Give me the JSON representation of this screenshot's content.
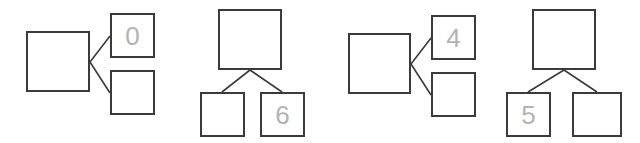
{
  "canvas": {
    "width": 640,
    "height": 143,
    "background": "#ffffff"
  },
  "style": {
    "node_border_color": "#3b3b3b",
    "node_border_width": 2,
    "node_fill": "#ffffff",
    "edge_color": "#3b3b3b",
    "edge_width": 1.6,
    "label_color": "#b3b3b3",
    "label_font_size": 26
  },
  "diagrams": [
    {
      "id": "diagram-1",
      "orientation": "horizontal",
      "offset_x": 0,
      "parent": {
        "name": "parent",
        "label": "",
        "x": 26,
        "y": 31,
        "w": 64,
        "h": 61
      },
      "children": [
        {
          "name": "child-top",
          "label": "0",
          "x": 110,
          "y": 13,
          "w": 45,
          "h": 45
        },
        {
          "name": "child-bottom",
          "label": "",
          "x": 110,
          "y": 70,
          "w": 45,
          "h": 45
        }
      ],
      "edges": [
        {
          "from": "parent",
          "to": "child-top",
          "x1": 90,
          "y1": 62,
          "x2": 110,
          "y2": 36
        },
        {
          "from": "parent",
          "to": "child-bottom",
          "x1": 90,
          "y1": 62,
          "x2": 110,
          "y2": 93
        }
      ]
    },
    {
      "id": "diagram-2",
      "orientation": "vertical",
      "offset_x": 160,
      "parent": {
        "name": "parent",
        "label": "",
        "x": 58,
        "y": 9,
        "w": 64,
        "h": 61
      },
      "children": [
        {
          "name": "child-left",
          "label": "",
          "x": 40,
          "y": 92,
          "w": 45,
          "h": 45
        },
        {
          "name": "child-right",
          "label": "6",
          "x": 100,
          "y": 92,
          "w": 45,
          "h": 45
        }
      ],
      "edges": [
        {
          "from": "parent",
          "to": "child-left",
          "x1": 90,
          "y1": 70,
          "x2": 62,
          "y2": 92
        },
        {
          "from": "parent",
          "to": "child-right",
          "x1": 90,
          "y1": 70,
          "x2": 122,
          "y2": 92
        }
      ]
    },
    {
      "id": "diagram-3",
      "orientation": "horizontal",
      "offset_x": 320,
      "parent": {
        "name": "parent",
        "label": "",
        "x": 28,
        "y": 33,
        "w": 63,
        "h": 61
      },
      "children": [
        {
          "name": "child-top",
          "label": "4",
          "x": 111,
          "y": 15,
          "w": 45,
          "h": 45
        },
        {
          "name": "child-bottom",
          "label": "",
          "x": 111,
          "y": 72,
          "w": 45,
          "h": 45
        }
      ],
      "edges": [
        {
          "from": "parent",
          "to": "child-top",
          "x1": 91,
          "y1": 64,
          "x2": 111,
          "y2": 38
        },
        {
          "from": "parent",
          "to": "child-bottom",
          "x1": 91,
          "y1": 64,
          "x2": 111,
          "y2": 95
        }
      ]
    },
    {
      "id": "diagram-4",
      "orientation": "vertical",
      "offset_x": 480,
      "parent": {
        "name": "parent",
        "label": "",
        "x": 52,
        "y": 9,
        "w": 64,
        "h": 61
      },
      "children": [
        {
          "name": "child-left",
          "label": "5",
          "x": 26,
          "y": 92,
          "w": 45,
          "h": 45
        },
        {
          "name": "child-right",
          "label": "",
          "x": 92,
          "y": 92,
          "w": 50,
          "h": 45
        }
      ],
      "edges": [
        {
          "from": "parent",
          "to": "child-left",
          "x1": 84,
          "y1": 70,
          "x2": 48,
          "y2": 92
        },
        {
          "from": "parent",
          "to": "child-right",
          "x1": 84,
          "y1": 70,
          "x2": 117,
          "y2": 92
        }
      ]
    }
  ]
}
